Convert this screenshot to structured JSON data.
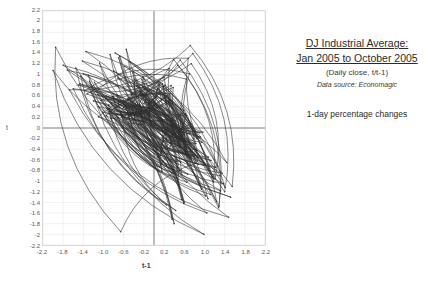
{
  "caption": {
    "title_line1": "DJ Industrial Average:",
    "title_line2": "Jan 2005 to October 2005 ",
    "subtitle": "(Daily close, t/t-1)",
    "source": "Data source: Economagic",
    "note": "1-day percentage changes"
  },
  "axes": {
    "ylabel": "t",
    "xlabel": "t-1",
    "yticks": [
      "2.2",
      "2",
      "1.8",
      "1.6",
      "1.4",
      "1.2",
      "1",
      "0.8",
      "0.6",
      "0.4",
      "0.2",
      "0",
      "-0.2",
      "-0.4",
      "-0.6",
      "-0.8",
      "-1",
      "-1.2",
      "-1.4",
      "-1.6",
      "-1.8",
      "-2",
      "-2.2"
    ],
    "ytick_values": [
      2.2,
      2.0,
      1.8,
      1.6,
      1.4,
      1.2,
      1.0,
      0.8,
      0.6,
      0.4,
      0.2,
      0,
      -0.2,
      -0.4,
      -0.6,
      -0.8,
      -1.0,
      -1.2,
      -1.4,
      -1.6,
      -1.8,
      -2.0,
      -2.2
    ],
    "xticks": [
      "-2.2",
      "-1.8",
      "-1.4",
      "-1.0",
      "-0.6",
      "-0.2",
      "0.2",
      "0.6",
      "1.0",
      "1.4",
      "1.8",
      "2.2"
    ],
    "xtick_values": [
      -2.2,
      -1.8,
      -1.4,
      -1.0,
      -0.6,
      -0.2,
      0.2,
      0.6,
      1.0,
      1.4,
      1.8,
      2.2
    ]
  },
  "colors": {
    "line": "#2e2e2e",
    "grid": "#e2e2e2",
    "zero_axis": "#6b6b6b",
    "border": "#d9d9d9",
    "tick_text": "#5a5a5a"
  },
  "chart_data": {
    "type": "scatter",
    "title": "DJ Industrial Average: Jan 2005 to October 2005",
    "subtitle": "(Daily close, t/t-1) — 1-day percentage changes",
    "xlabel": "t-1",
    "ylabel": "t",
    "xlim": [
      -2.2,
      2.2
    ],
    "ylim": [
      -2.2,
      2.2
    ],
    "grid": true,
    "legend": "none",
    "connected": true,
    "marker": "small-dot",
    "x": [
      0.42,
      -0.35,
      0.78,
      -0.21,
      0.55,
      -0.88,
      0.31,
      0.64,
      -0.47,
      0.12,
      0.86,
      -0.62,
      0.29,
      -0.14,
      0.73,
      0.08,
      -0.55,
      0.41,
      -0.93,
      0.37,
      0.19,
      -0.26,
      0.68,
      -0.71,
      0.44,
      0.05,
      -0.38,
      0.92,
      -0.17,
      0.53,
      -0.64,
      0.22,
      0.81,
      -0.49,
      0.16,
      -0.82,
      0.59,
      0.33,
      -0.28,
      0.7,
      -0.11,
      0.47,
      -0.75,
      0.25,
      0.61,
      -0.41,
      0.09,
      0.88,
      -0.56,
      0.36,
      0.14,
      -0.69,
      0.52,
      -0.23,
      0.77,
      0.02,
      -0.44,
      0.65,
      -1.02,
      0.3,
      0.48,
      -0.33,
      0.71,
      -0.58,
      0.2,
      0.95,
      -0.27,
      0.43,
      -0.86,
      0.18,
      0.57,
      -0.15,
      0.34,
      0.8,
      -0.51,
      0.11,
      -0.73,
      0.62,
      0.27,
      -0.39,
      0.85,
      -0.2,
      0.46,
      -0.95,
      0.23,
      0.66,
      -0.31,
      0.07,
      0.74,
      -0.6,
      0.39,
      0.15,
      -0.48,
      0.58,
      -0.24,
      0.91,
      -0.09,
      0.4,
      -0.79,
      0.32,
      0.53,
      -0.36,
      0.69,
      -0.54,
      0.17,
      0.83,
      -0.29,
      0.45,
      -0.67,
      0.26,
      0.6,
      -0.13,
      0.38,
      0.76,
      -0.45,
      0.1,
      -0.81,
      0.64,
      0.24,
      -0.34,
      0.89,
      -0.19,
      0.49,
      -1.1,
      0.21,
      0.63,
      -0.26,
      0.06,
      0.72,
      -0.57,
      0.41,
      0.13,
      -0.52,
      0.56,
      -0.22,
      0.97,
      -0.08,
      0.35,
      -0.84,
      0.28,
      0.5,
      -0.37,
      0.67,
      -0.5,
      0.19,
      0.79,
      -0.3,
      0.44,
      -0.63,
      0.25,
      -1.45,
      0.98,
      -0.7,
      1.32,
      -1.18,
      0.86,
      -0.42,
      1.05,
      -1.6,
      0.74,
      1.21,
      -0.96,
      0.55,
      -1.35,
      1.44,
      -0.65,
      0.3,
      1.12,
      -1.25,
      0.67,
      -0.87,
      1.38,
      -1.05,
      0.52,
      1.28,
      -1.5,
      0.81,
      -0.58,
      1.16,
      -0.92,
      0.36,
      -1.72,
      1.09,
      -0.77,
      1.41,
      -1.12,
      0.63,
      -0.48,
      1.24,
      -1.38,
      0.7,
      1.02,
      -1.28,
      0.88,
      -0.68,
      1.35,
      -0.85,
      0.47,
      1.18,
      -1.02,
      0.59,
      -1.42,
      1.26,
      -0.72,
      0.94,
      -1.15,
      0.68,
      1.31,
      -0.9,
      0.43,
      -1.55,
      1.13,
      -0.61,
      0.77,
      1.4,
      -1.2,
      0.51,
      -0.8,
      1.07,
      -1.33,
      0.64,
      0.92,
      -1.08,
      1.22,
      -0.74,
      0.39,
      1.29,
      -1.47,
      0.83,
      -0.66,
      -1.95,
      1.52,
      -1.3,
      0.99,
      -2.0,
      1.08,
      -0.55,
      1.48,
      -1.68,
      0.72,
      1.55,
      -1.1,
      0.4,
      -1.8,
      1.18,
      -0.95,
      0.6,
      -1.4,
      1.02,
      -0.7
    ],
    "y": [
      -0.35,
      0.78,
      -0.21,
      0.55,
      -0.88,
      0.31,
      0.64,
      -0.47,
      0.12,
      0.86,
      -0.62,
      0.29,
      -0.14,
      0.73,
      0.08,
      -0.55,
      0.41,
      -0.93,
      0.37,
      0.19,
      -0.26,
      0.68,
      -0.71,
      0.44,
      0.05,
      -0.38,
      0.92,
      -0.17,
      0.53,
      -0.64,
      0.22,
      0.81,
      -0.49,
      0.16,
      -0.82,
      0.59,
      0.33,
      -0.28,
      0.7,
      -0.11,
      0.47,
      -0.75,
      0.25,
      0.61,
      -0.41,
      0.09,
      0.88,
      -0.56,
      0.36,
      0.14,
      -0.69,
      0.52,
      -0.23,
      0.77,
      0.02,
      -0.44,
      0.65,
      -1.02,
      0.3,
      0.48,
      -0.33,
      0.71,
      -0.58,
      0.2,
      0.95,
      -0.27,
      0.43,
      -0.86,
      0.18,
      0.57,
      -0.15,
      0.34,
      0.8,
      -0.51,
      0.11,
      -0.73,
      0.62,
      0.27,
      -0.39,
      0.85,
      -0.2,
      0.46,
      -0.95,
      0.23,
      0.66,
      -0.31,
      0.07,
      0.74,
      -0.6,
      0.39,
      0.15,
      -0.48,
      0.58,
      -0.24,
      0.91,
      -0.09,
      0.4,
      -0.79,
      0.32,
      0.53,
      -0.36,
      0.69,
      -0.54,
      0.17,
      0.83,
      -0.29,
      0.45,
      -0.67,
      0.26,
      0.6,
      -0.13,
      0.38,
      0.76,
      -0.45,
      0.1,
      -0.81,
      0.64,
      0.24,
      -0.34,
      0.89,
      -0.19,
      0.49,
      -1.1,
      0.21,
      0.63,
      -0.26,
      0.06,
      0.72,
      -0.57,
      0.41,
      0.13,
      -0.52,
      0.56,
      -0.22,
      0.97,
      -0.08,
      0.35,
      -0.84,
      0.28,
      0.5,
      -0.37,
      0.67,
      -0.5,
      0.19,
      0.79,
      -0.3,
      0.44,
      -0.63,
      0.25,
      -1.45,
      0.98,
      -0.7,
      1.32,
      -1.18,
      0.86,
      -0.42,
      1.05,
      -1.6,
      0.74,
      1.21,
      -0.96,
      0.55,
      -1.35,
      1.44,
      -0.65,
      0.3,
      1.12,
      -1.25,
      0.67,
      -0.87,
      1.38,
      -1.05,
      0.52,
      1.28,
      -1.5,
      0.81,
      -0.58,
      1.16,
      -0.92,
      0.36,
      -1.72,
      1.09,
      -0.77,
      1.41,
      -1.12,
      0.63,
      -0.48,
      1.24,
      -1.38,
      0.7,
      1.02,
      -1.28,
      0.88,
      -0.68,
      1.35,
      -0.85,
      0.47,
      1.18,
      -1.02,
      0.59,
      -1.42,
      1.26,
      -0.72,
      0.94,
      -1.15,
      0.68,
      1.31,
      -0.9,
      0.43,
      -1.55,
      1.13,
      -0.61,
      0.77,
      1.4,
      -1.2,
      0.51,
      -0.8,
      1.07,
      -1.33,
      0.64,
      0.92,
      -1.08,
      1.22,
      -0.74,
      0.39,
      1.29,
      -1.47,
      0.83,
      -0.66,
      -1.95,
      1.52,
      -1.3,
      0.99,
      -2.0,
      1.08,
      -0.55,
      1.48,
      -1.68,
      0.72,
      1.55,
      -1.1,
      0.4,
      -1.8,
      1.18,
      -0.95,
      0.6,
      -1.4,
      1.02,
      -0.7,
      0.45
    ]
  }
}
